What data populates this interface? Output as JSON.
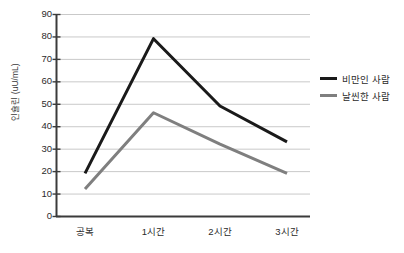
{
  "chart_data": {
    "type": "line",
    "title": "",
    "xlabel": "",
    "ylabel": "인슐린 (uU/mL)",
    "categories": [
      "공복",
      "1시간",
      "2시간",
      "3시간"
    ],
    "ylim": [
      0,
      90
    ],
    "ytick_step": 10,
    "yticks": [
      90,
      80,
      70,
      60,
      50,
      40,
      30,
      20,
      10,
      0
    ],
    "grid": true,
    "grid_axis": "y",
    "legend_position": "right",
    "series": [
      {
        "name": "비만인 사람",
        "color": "#1a1a1a",
        "values": [
          19,
          79,
          49,
          33
        ]
      },
      {
        "name": "날씬한 사람",
        "color": "#7f7f7f",
        "values": [
          12,
          46,
          32,
          19
        ]
      }
    ]
  },
  "axis": {
    "y_title": "인슐린 (uU/mL)",
    "y_labels": [
      "90",
      "80",
      "70",
      "60",
      "50",
      "40",
      "30",
      "20",
      "10",
      "0"
    ],
    "x_labels": [
      "공복",
      "1시간",
      "2시간",
      "3시간"
    ]
  },
  "legend": {
    "items": [
      {
        "label": "비만인 사람",
        "color": "#1a1a1a"
      },
      {
        "label": "날씬한 사람",
        "color": "#7f7f7f"
      }
    ]
  },
  "colors": {
    "series_obese": "#1a1a1a",
    "series_lean": "#7f7f7f",
    "gridline": "#c9c9c9",
    "axis": "#3b3b3b",
    "background": "#ffffff"
  }
}
